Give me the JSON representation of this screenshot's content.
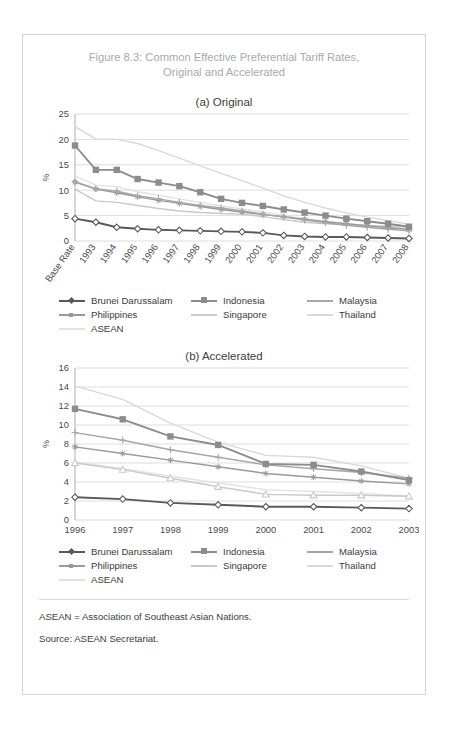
{
  "figure": {
    "title_line1": "Figure 8.3: Common Effective Preferential Tariff Rates,",
    "title_line2": "Original and Accelerated",
    "panel_a_title": "(a) Original",
    "panel_b_title": "(b) Accelerated",
    "note_abbrev": "ASEAN = Association of Southeast Asian Nations.",
    "note_source": "Source: ASEAN Secretariat."
  },
  "colors": {
    "brunei": "#595959",
    "indonesia": "#8c8c8c",
    "malaysia": "#a6a6a6",
    "philippines": "#999999",
    "singapore": "#c9c9c9",
    "thailand": "#d9d9d9",
    "asean": "#e2e2e2",
    "gridline": "#bfbfbf",
    "axis": "#9a9a9a",
    "title": "#a9a9a9",
    "text": "#3c3c3c"
  },
  "legend": {
    "row1": [
      {
        "label": "Brunei Darussalam",
        "key": "brunei",
        "marker": "diamond"
      },
      {
        "label": "Indonesia",
        "key": "indonesia",
        "marker": "square"
      },
      {
        "label": "Malaysia",
        "key": "malaysia",
        "marker": "cross"
      }
    ],
    "row2": [
      {
        "label": "Philippines",
        "key": "philippines",
        "marker": "star"
      },
      {
        "label": "Singapore",
        "key": "singapore",
        "marker": "none"
      },
      {
        "label": "Thailand",
        "key": "thailand",
        "marker": "none"
      }
    ],
    "row3": [
      {
        "label": "ASEAN",
        "key": "asean",
        "marker": "none"
      }
    ]
  },
  "chart_data": [
    {
      "id": "original",
      "type": "line",
      "title": "(a) Original",
      "xlabel": "",
      "ylabel": "%",
      "ylim": [
        0,
        25
      ],
      "yticks": [
        0,
        5,
        10,
        15,
        20,
        25
      ],
      "grid": true,
      "legend_position": "bottom",
      "categories": [
        "Base Rate",
        "1993",
        "1994",
        "1995",
        "1996",
        "1997",
        "1998",
        "1999",
        "2000",
        "2001",
        "2002",
        "2003",
        "2004",
        "2005",
        "2006",
        "2007",
        "2008"
      ],
      "series": [
        {
          "name": "Brunei Darussalam",
          "key": "brunei",
          "marker": "diamond",
          "values": [
            4.4,
            3.7,
            2.7,
            2.4,
            2.2,
            2.1,
            2.0,
            1.9,
            1.8,
            1.6,
            1.1,
            0.9,
            0.8,
            0.8,
            0.7,
            0.6,
            0.5
          ]
        },
        {
          "name": "Indonesia",
          "key": "indonesia",
          "marker": "square",
          "values": [
            18.8,
            14.0,
            14.0,
            12.2,
            11.5,
            10.8,
            9.6,
            8.3,
            7.5,
            6.9,
            6.2,
            5.6,
            5.0,
            4.4,
            3.9,
            3.4,
            2.8
          ]
        },
        {
          "name": "Malaysia",
          "key": "malaysia",
          "marker": "cross",
          "values": [
            11.7,
            10.3,
            9.8,
            8.9,
            8.3,
            7.6,
            7.0,
            6.5,
            5.9,
            5.3,
            4.7,
            4.1,
            3.6,
            3.1,
            2.7,
            2.3,
            2.0
          ]
        },
        {
          "name": "Philippines",
          "key": "philippines",
          "marker": "star",
          "values": [
            11.6,
            10.2,
            9.5,
            8.7,
            8.0,
            7.4,
            6.8,
            6.2,
            5.7,
            5.2,
            4.8,
            4.3,
            3.8,
            3.4,
            3.0,
            2.6,
            2.3
          ]
        },
        {
          "name": "Singapore",
          "key": "singapore",
          "marker": "none",
          "values": [
            10.2,
            7.9,
            7.6,
            7.0,
            6.4,
            5.9,
            5.6,
            5.4,
            5.3,
            4.8,
            4.2,
            3.7,
            3.4,
            3.2,
            3.0,
            2.9,
            2.8
          ]
        },
        {
          "name": "Thailand",
          "key": "thailand",
          "marker": "none",
          "values": [
            22.5,
            20.1,
            20.0,
            19.2,
            17.8,
            16.3,
            14.8,
            13.3,
            11.9,
            10.4,
            8.9,
            7.6,
            6.5,
            5.5,
            4.7,
            4.0,
            3.3
          ]
        },
        {
          "name": "ASEAN",
          "key": "asean",
          "marker": "none",
          "values": [
            12.8,
            11.0,
            10.7,
            9.7,
            9.0,
            8.3,
            7.6,
            6.9,
            6.3,
            5.7,
            5.0,
            4.4,
            3.9,
            3.4,
            3.0,
            2.6,
            2.3
          ]
        }
      ]
    },
    {
      "id": "accelerated",
      "type": "line",
      "title": "(b) Accelerated",
      "xlabel": "",
      "ylabel": "%",
      "ylim": [
        0,
        16
      ],
      "yticks": [
        0,
        2,
        4,
        6,
        8,
        10,
        12,
        14,
        16
      ],
      "grid": true,
      "legend_position": "bottom",
      "categories": [
        "1996",
        "1997",
        "1998",
        "1999",
        "2000",
        "2001",
        "2002",
        "2003"
      ],
      "series": [
        {
          "name": "Brunei Darussalam",
          "key": "brunei",
          "marker": "diamond",
          "values": [
            2.4,
            2.2,
            1.8,
            1.6,
            1.4,
            1.4,
            1.3,
            1.2
          ]
        },
        {
          "name": "Indonesia",
          "key": "indonesia",
          "marker": "square",
          "values": [
            11.7,
            10.6,
            8.8,
            7.9,
            5.9,
            5.8,
            5.1,
            4.2
          ]
        },
        {
          "name": "Malaysia",
          "key": "malaysia",
          "marker": "cross",
          "values": [
            9.2,
            8.4,
            7.4,
            6.6,
            5.8,
            5.4,
            5.0,
            4.4
          ]
        },
        {
          "name": "Philippines",
          "key": "philippines",
          "marker": "star",
          "values": [
            7.7,
            7.0,
            6.3,
            5.6,
            4.9,
            4.5,
            4.1,
            3.8
          ]
        },
        {
          "name": "Singapore",
          "key": "singapore",
          "marker": "triangle",
          "values": [
            6.0,
            5.3,
            4.4,
            3.5,
            2.7,
            2.6,
            2.6,
            2.5
          ]
        },
        {
          "name": "Thailand",
          "key": "thailand",
          "marker": "none",
          "values": [
            14.1,
            12.7,
            10.2,
            8.2,
            6.8,
            6.6,
            5.7,
            4.4
          ]
        },
        {
          "name": "ASEAN",
          "key": "asean",
          "marker": "none",
          "values": [
            6.1,
            5.4,
            4.6,
            3.9,
            3.2,
            3.0,
            2.8,
            2.5
          ]
        }
      ]
    }
  ]
}
